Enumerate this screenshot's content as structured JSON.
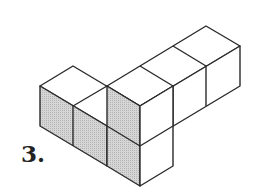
{
  "problem": {
    "number_label": "3.",
    "description": "Isometric drawing of an arrangement of unit cubes; left-facing front faces are shaded"
  },
  "style": {
    "stroke": "#2a2a2a",
    "shaded_fill": "#c8c8c8",
    "face_fill": "#ffffff"
  }
}
